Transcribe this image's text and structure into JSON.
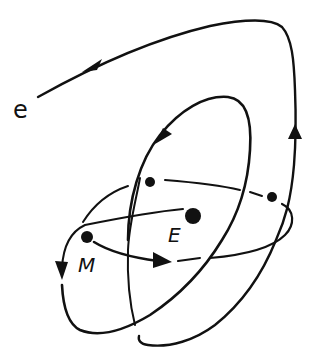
{
  "diagram": {
    "stroke_color": "#111111",
    "background_color": "#ffffff",
    "labels": {
      "electron": "e",
      "earth": "E",
      "moon": "M"
    },
    "points": [
      {
        "name": "moon",
        "label": "M",
        "x": 87,
        "y": 237,
        "r": 6
      },
      {
        "name": "earth",
        "label": "E",
        "x": 193,
        "y": 216,
        "r": 8
      },
      {
        "name": "orbit-point-left",
        "x": 150,
        "y": 182,
        "r": 5
      },
      {
        "name": "orbit-point-right",
        "x": 272,
        "y": 197,
        "r": 5
      }
    ],
    "arrows": [
      {
        "name": "outer-trajectory-arrow-top",
        "direction": "down-left",
        "x": 95,
        "y": 65
      },
      {
        "name": "outer-trajectory-arrow-right",
        "direction": "up",
        "x": 295,
        "y": 135
      },
      {
        "name": "inner-orbit-arrow",
        "direction": "down-left",
        "x": 163,
        "y": 134
      },
      {
        "name": "moon-orbit-arrow",
        "direction": "right",
        "x": 160,
        "y": 262
      },
      {
        "name": "left-loop-arrow",
        "direction": "down",
        "x": 62,
        "y": 268
      }
    ]
  }
}
